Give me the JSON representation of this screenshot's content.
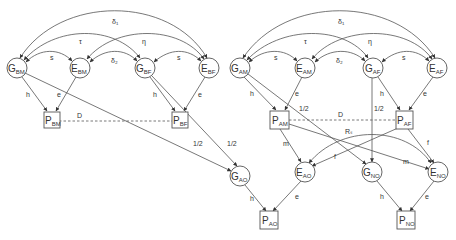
{
  "diagram": {
    "type": "path-diagram",
    "nodes": [
      {
        "id": "G_BM",
        "main": "G",
        "sub": "BM",
        "shape": "circle",
        "x": 17,
        "y": 68
      },
      {
        "id": "E_BM",
        "main": "E",
        "sub": "BM",
        "shape": "circle",
        "x": 80,
        "y": 68
      },
      {
        "id": "G_BF",
        "main": "G",
        "sub": "BF",
        "shape": "circle",
        "x": 145,
        "y": 68
      },
      {
        "id": "E_BF",
        "main": "E",
        "sub": "BF",
        "shape": "circle",
        "x": 209,
        "y": 68
      },
      {
        "id": "P_BM",
        "main": "P",
        "sub": "BM",
        "shape": "box",
        "x": 52,
        "y": 121
      },
      {
        "id": "P_BF",
        "main": "P",
        "sub": "BF",
        "shape": "box",
        "x": 180,
        "y": 121
      },
      {
        "id": "G_AO",
        "main": "G",
        "sub": "AO",
        "shape": "circle",
        "x": 240,
        "y": 176
      },
      {
        "id": "P_AO",
        "main": "P",
        "sub": "AO",
        "shape": "box",
        "x": 269,
        "y": 220
      },
      {
        "id": "G_AM",
        "main": "G",
        "sub": "AM",
        "shape": "circle",
        "x": 240,
        "y": 68
      },
      {
        "id": "E_AM",
        "main": "E",
        "sub": "AM",
        "shape": "circle",
        "x": 305,
        "y": 68
      },
      {
        "id": "G_AF",
        "main": "G",
        "sub": "AF",
        "shape": "circle",
        "x": 373,
        "y": 68
      },
      {
        "id": "E_AF",
        "main": "E",
        "sub": "AF",
        "shape": "circle",
        "x": 437,
        "y": 68
      },
      {
        "id": "P_AM",
        "main": "P",
        "sub": "AM",
        "shape": "box",
        "x": 281,
        "y": 120
      },
      {
        "id": "P_AF",
        "main": "P",
        "sub": "AF",
        "shape": "box",
        "x": 404,
        "y": 120
      },
      {
        "id": "E_AO",
        "main": "E",
        "sub": "AO",
        "shape": "circle",
        "x": 305,
        "y": 172
      },
      {
        "id": "G_NO",
        "main": "G",
        "sub": "NO",
        "shape": "circle",
        "x": 372,
        "y": 172
      },
      {
        "id": "E_NO",
        "main": "E",
        "sub": "NO",
        "shape": "circle",
        "x": 438,
        "y": 172
      },
      {
        "id": "P_NO",
        "main": "P",
        "sub": "NO",
        "shape": "box",
        "x": 406,
        "y": 220
      }
    ],
    "edge_labels": {
      "delta1": "δ₁",
      "delta2": "δ₂",
      "tau": "τ",
      "eta": "η",
      "s": "s",
      "h": "h",
      "e": "e",
      "D": "D",
      "half": "1/2",
      "m": "m",
      "f": "f",
      "Rs": "Rₛ"
    }
  }
}
